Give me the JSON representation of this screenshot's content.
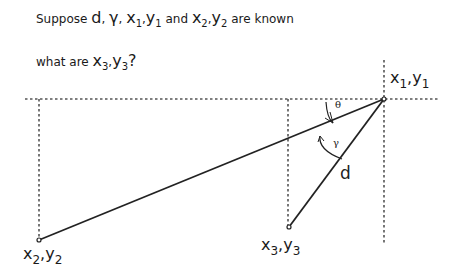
{
  "question": {
    "line1": {
      "prefix": "Suppose ",
      "d": "d",
      "sep1": ", ",
      "gamma": "γ",
      "sep2": ", ",
      "x1": "x",
      "x1_sub": "1",
      "comma1": ",",
      "y1": "y",
      "y1_sub": "1",
      "and": " and ",
      "x2": "x",
      "x2_sub": "2",
      "comma2": ",",
      "y2": "y",
      "y2_sub": "2",
      "suffix": " are known"
    },
    "line2": {
      "prefix": "what are ",
      "x3": "x",
      "x3_sub": "3",
      "comma": ",",
      "y3": "y",
      "y3_sub": "3",
      "suffix": "?"
    }
  },
  "diagram": {
    "points": {
      "p1": {
        "x": "x",
        "x_sub": "1",
        "sep": ",",
        "y": "y",
        "y_sub": "1"
      },
      "p2": {
        "x": "x",
        "x_sub": "2",
        "sep": ",",
        "y": "y",
        "y_sub": "2"
      },
      "p3": {
        "x": "x",
        "x_sub": "3",
        "sep": ",",
        "y": "y",
        "y_sub": "3"
      }
    },
    "angle_theta": "θ",
    "angle_gamma": "γ",
    "distance_label": "d",
    "colors": {
      "line": "#222222",
      "dotted": "#555555"
    }
  }
}
